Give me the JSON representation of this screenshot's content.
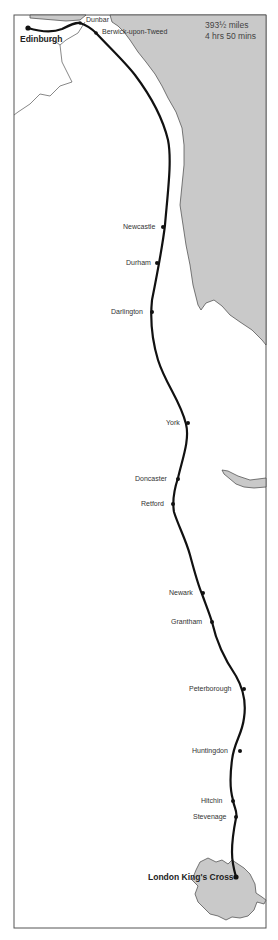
{
  "map": {
    "title": "East Coast Main Line route map",
    "distance": "393½ miles",
    "journey_time": "4 hrs 50 mins",
    "colors": {
      "sea": "#c9c9c9",
      "land": "#ffffff",
      "route": "#111111",
      "border": "#555555",
      "london_area": "#c9c9c9"
    },
    "stations": [
      {
        "name": "Edinburgh",
        "terminus": true
      },
      {
        "name": "Dunbar"
      },
      {
        "name": "Berwick-upon-Tweed"
      },
      {
        "name": "Newcastle"
      },
      {
        "name": "Durham"
      },
      {
        "name": "Darlington"
      },
      {
        "name": "York"
      },
      {
        "name": "Doncaster"
      },
      {
        "name": "Retford"
      },
      {
        "name": "Newark"
      },
      {
        "name": "Grantham"
      },
      {
        "name": "Peterborough"
      },
      {
        "name": "Huntingdon"
      },
      {
        "name": "Hitchin"
      },
      {
        "name": "Stevenage"
      },
      {
        "name": "London King's Cross",
        "terminus": true
      }
    ]
  }
}
